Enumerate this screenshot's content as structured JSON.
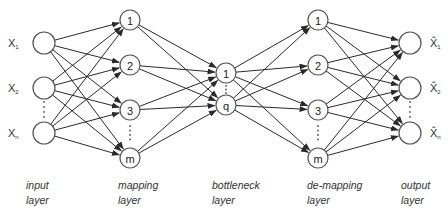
{
  "diagram": {
    "type": "autoassociative neural network",
    "layers": [
      {
        "id": "input",
        "label_line1": "input",
        "label_line2": "layer",
        "x": 44,
        "nodes": [
          {
            "label": "",
            "y": 43,
            "var": "X",
            "sub": "1"
          },
          {
            "label": "",
            "y": 88,
            "var": "X",
            "sub": "2"
          },
          {
            "label": "",
            "y": 133,
            "var": "X",
            "sub": "n"
          }
        ]
      },
      {
        "id": "mapping",
        "label_line1": "mapping",
        "label_line2": "layer",
        "x": 130,
        "nodes": [
          {
            "label": "1",
            "y": 20
          },
          {
            "label": "2",
            "y": 65
          },
          {
            "label": "3",
            "y": 110
          },
          {
            "label": "m",
            "y": 158
          }
        ]
      },
      {
        "id": "bottleneck",
        "label_line1": "bottleneck",
        "label_line2": "layer",
        "x": 226,
        "nodes": [
          {
            "label": "1",
            "y": 73
          },
          {
            "label": "q",
            "y": 105
          }
        ]
      },
      {
        "id": "demapping",
        "label_line1": "de-mapping",
        "label_line2": "layer",
        "x": 318,
        "nodes": [
          {
            "label": "1",
            "y": 20
          },
          {
            "label": "2",
            "y": 65
          },
          {
            "label": "3",
            "y": 110
          },
          {
            "label": "m",
            "y": 158
          }
        ]
      },
      {
        "id": "output",
        "label_line1": "output",
        "label_line2": "layer",
        "x": 410,
        "nodes": [
          {
            "label": "",
            "y": 43,
            "var": "X̂",
            "sub": "1"
          },
          {
            "label": "",
            "y": 88,
            "var": "X̂",
            "sub": "2"
          },
          {
            "label": "",
            "y": 133,
            "var": "X̂",
            "sub": "n"
          }
        ]
      }
    ],
    "labels": {
      "input": [
        "input",
        "layer"
      ],
      "mapping": [
        "mapping",
        "layer"
      ],
      "bottleneck": [
        "bottleneck",
        "layer"
      ],
      "demapping": [
        "de-mapping",
        "layer"
      ],
      "output": [
        "output",
        "layer"
      ]
    },
    "colors": {
      "edge": "#2a2a2a",
      "node_stroke": "#555555",
      "text": "#333333"
    }
  }
}
